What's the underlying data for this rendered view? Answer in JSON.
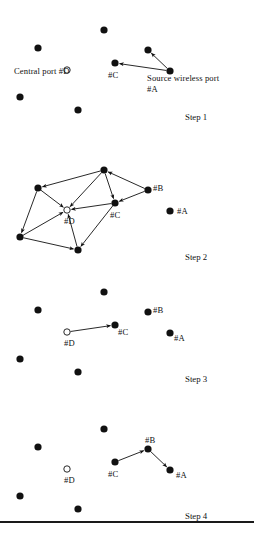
{
  "figure": {
    "type": "network-routing-steps",
    "width": 254,
    "height": 533,
    "background": "#ffffff",
    "ink": "#111111",
    "node_radius": 3.6,
    "hollow_node_radius": 3.2,
    "nodes": {
      "n_top": {
        "x": 104,
        "y": 30
      },
      "n_left": {
        "x": 38,
        "y": 48
      },
      "D": {
        "x": 67,
        "y": 70
      },
      "n_botleft": {
        "x": 20,
        "y": 97
      },
      "n_bottom": {
        "x": 78,
        "y": 110
      },
      "C": {
        "x": 115,
        "y": 63
      },
      "B": {
        "x": 148,
        "y": 50
      },
      "A": {
        "x": 170,
        "y": 71
      }
    },
    "legend": {
      "central_port": "Central port #D",
      "source_port_line1": "Source wireless port",
      "source_port_line2": "#A"
    },
    "node_labels": {
      "A": "#A",
      "B": "#B",
      "C": "#C",
      "D": "#D"
    },
    "steps": [
      {
        "caption": "Step 1",
        "offset_y": 0,
        "hollow": [
          "D"
        ],
        "edges": [
          {
            "from": "A",
            "to": "B"
          },
          {
            "from": "A",
            "to": "C"
          }
        ]
      },
      {
        "caption": "Step 2",
        "offset_y": 140,
        "hollow": [
          "D"
        ],
        "edges": [
          {
            "from": "n_top",
            "to": "n_left"
          },
          {
            "from": "n_top",
            "to": "D"
          },
          {
            "from": "n_top",
            "to": "C"
          },
          {
            "from": "B",
            "to": "n_top"
          },
          {
            "from": "B",
            "to": "C"
          },
          {
            "from": "n_left",
            "to": "D"
          },
          {
            "from": "n_left",
            "to": "n_botleft"
          },
          {
            "from": "n_botleft",
            "to": "D"
          },
          {
            "from": "n_botleft",
            "to": "n_bottom"
          },
          {
            "from": "n_bottom",
            "to": "D"
          },
          {
            "from": "C",
            "to": "D"
          },
          {
            "from": "C",
            "to": "n_bottom"
          }
        ]
      },
      {
        "caption": "Step 3",
        "offset_y": 262,
        "hollow": [
          "D"
        ],
        "edges": [
          {
            "from": "D",
            "to": "C"
          }
        ]
      },
      {
        "caption": "Step 4",
        "offset_y": 399,
        "hollow": [
          "D"
        ],
        "edges": [
          {
            "from": "C",
            "to": "B"
          },
          {
            "from": "B",
            "to": "A"
          }
        ]
      }
    ],
    "bottom_rule_y": 521
  }
}
